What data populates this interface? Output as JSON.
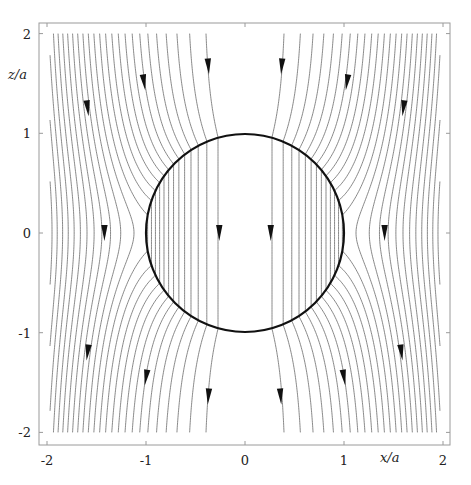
{
  "figure": {
    "xlabel": "x/a",
    "ylabel": "z/a",
    "x_ticks": [
      {
        "value": -2,
        "label": "-2"
      },
      {
        "value": -1,
        "label": "-1"
      },
      {
        "value": 0,
        "label": "0"
      },
      {
        "value": 1,
        "label": "1"
      },
      {
        "value": 2,
        "label": "2"
      }
    ],
    "y_ticks": [
      {
        "value": 2,
        "label": "2"
      },
      {
        "value": 1,
        "label": "1"
      },
      {
        "value": 0,
        "label": "0"
      },
      {
        "value": -1,
        "label": "-1"
      },
      {
        "value": -2,
        "label": "-2"
      }
    ],
    "xlim": [
      -2.08,
      2.07
    ],
    "ylim": [
      -2.12,
      2.1
    ],
    "sphere": {
      "center": [
        0,
        0
      ],
      "radius": 1
    },
    "streamlines": {
      "dipole_strength_K": 0.72,
      "inner_spacing_rho2": 0.0744,
      "lines_per_side": 26,
      "direction": "down",
      "z_range": [
        -2,
        2
      ],
      "x_clip": 1.97
    },
    "arrows": [
      {
        "x": -1.59,
        "z": 1.25
      },
      {
        "x": -1.02,
        "z": 1.51
      },
      {
        "x": -0.37,
        "z": 1.67
      },
      {
        "x": 0.37,
        "z": 1.67
      },
      {
        "x": 1.03,
        "z": 1.51
      },
      {
        "x": 1.6,
        "z": 1.25
      },
      {
        "x": -1.42,
        "z": 0.0
      },
      {
        "x": -0.26,
        "z": 0.0
      },
      {
        "x": 0.26,
        "z": 0.0
      },
      {
        "x": 1.41,
        "z": 0.0
      },
      {
        "x": -1.59,
        "z": -1.2
      },
      {
        "x": -1.0,
        "z": -1.45
      },
      {
        "x": -0.37,
        "z": -1.64
      },
      {
        "x": 0.36,
        "z": -1.64
      },
      {
        "x": 1.0,
        "z": -1.45
      },
      {
        "x": 1.58,
        "z": -1.2
      }
    ],
    "colors": {
      "streamline": "#7a7a7a",
      "sphere": "#111111",
      "frame": "#9a9a9a",
      "arrow": "#111111",
      "text": "#222222"
    }
  }
}
